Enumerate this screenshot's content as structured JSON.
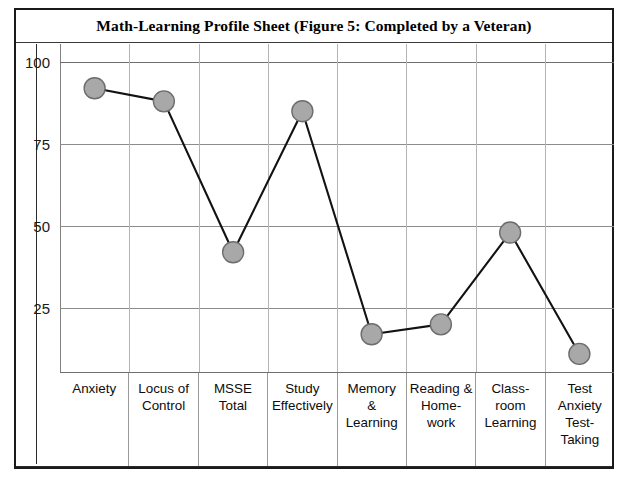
{
  "figure": {
    "title": "Math-Learning Profile Sheet (Figure 5: Completed by a Veteran)"
  },
  "chart_data": {
    "type": "line",
    "title": "Math-Learning Profile Sheet (Figure 5: Completed by a Veteran)",
    "xlabel": "",
    "ylabel": "",
    "ylim": [
      0,
      100
    ],
    "yticks": [
      100,
      75,
      50,
      25
    ],
    "grid": true,
    "legend": "none",
    "marker": "filled-circle",
    "marker_color": "#a8a8a8",
    "marker_edge_color": "#6d6d6d",
    "line_color": "#121212",
    "categories": [
      "Anxiety",
      "Locus of\nControl",
      "MSSE\nTotal",
      "Study\nEffectively",
      "Memory\n&\nLearning",
      "Reading &\nHome-\nwork",
      "Class-\nroom\nLearning",
      "Test\nAnxiety\nTest-\nTaking"
    ],
    "values": [
      92,
      88,
      42,
      85,
      17,
      20,
      48,
      11
    ]
  },
  "axis": {
    "ticks": [
      {
        "label": "100",
        "value": 100
      },
      {
        "label": "75",
        "value": 75
      },
      {
        "label": "50",
        "value": 50
      },
      {
        "label": "25",
        "value": 25
      }
    ]
  }
}
